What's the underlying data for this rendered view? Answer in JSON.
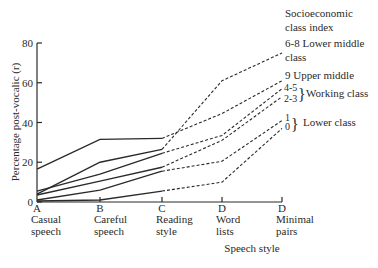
{
  "chart_data": {
    "type": "line",
    "title": "",
    "xlabel": "Speech style",
    "ylabel": "Percentage post-vocalic (r)",
    "ylim": [
      0,
      80
    ],
    "yticks": [
      0,
      20,
      40,
      60,
      80
    ],
    "grid": false,
    "categories": [
      {
        "letter": "A",
        "line1": "Casual",
        "line2": "speech"
      },
      {
        "letter": "B",
        "line1": "Careful",
        "line2": "speech"
      },
      {
        "letter": "C",
        "line1": "Reading",
        "line2": "style"
      },
      {
        "letter": "D",
        "line1": "Word",
        "line2": "lists"
      },
      {
        "letter": "D",
        "line1": "Minimal",
        "line2": "pairs"
      }
    ],
    "legend_title": [
      "Socioeconomic",
      "class index"
    ],
    "solid_until_index": 2,
    "series": [
      {
        "name": "6-8 Lower middle class",
        "values": [
          4,
          20,
          26.5,
          61,
          75
        ]
      },
      {
        "name": "9 Upper middle",
        "values": [
          16.5,
          31.5,
          32,
          44.5,
          61
        ]
      },
      {
        "name": "4-5",
        "values": [
          5.5,
          14,
          24.5,
          33.5,
          57
        ]
      },
      {
        "name": "2-3",
        "values": [
          3.5,
          10.5,
          17.5,
          31,
          53
        ]
      },
      {
        "name": "1",
        "values": [
          1,
          6,
          15.5,
          20.5,
          41
        ]
      },
      {
        "name": "0",
        "values": [
          0.5,
          1,
          5.5,
          10,
          37
        ]
      }
    ],
    "annotations": [
      {
        "text": "6-8 Lower middle",
        "text2": "class"
      },
      {
        "text": "9 Upper middle"
      },
      {
        "text": "4-5"
      },
      {
        "text": "2-3"
      },
      {
        "text": "Working class",
        "group": [
          "4-5",
          "2-3"
        ]
      },
      {
        "text": "1"
      },
      {
        "text": "0"
      },
      {
        "text": "Lower class",
        "group": [
          "1",
          "0"
        ]
      }
    ]
  },
  "labels": {
    "y_axis": "Percentage post-vocalic (r)",
    "x_axis": "Speech style",
    "legend_title_1": "Socioeconomic",
    "legend_title_2": "class index",
    "lm_1": "6-8 Lower middle",
    "lm_2": "class",
    "um": "9 Upper middle",
    "wc_45": "4-5",
    "wc_23": "2-3",
    "wc_label": "Working class",
    "lc_1": "1",
    "lc_0": "0",
    "lc_label": "Lower class"
  }
}
